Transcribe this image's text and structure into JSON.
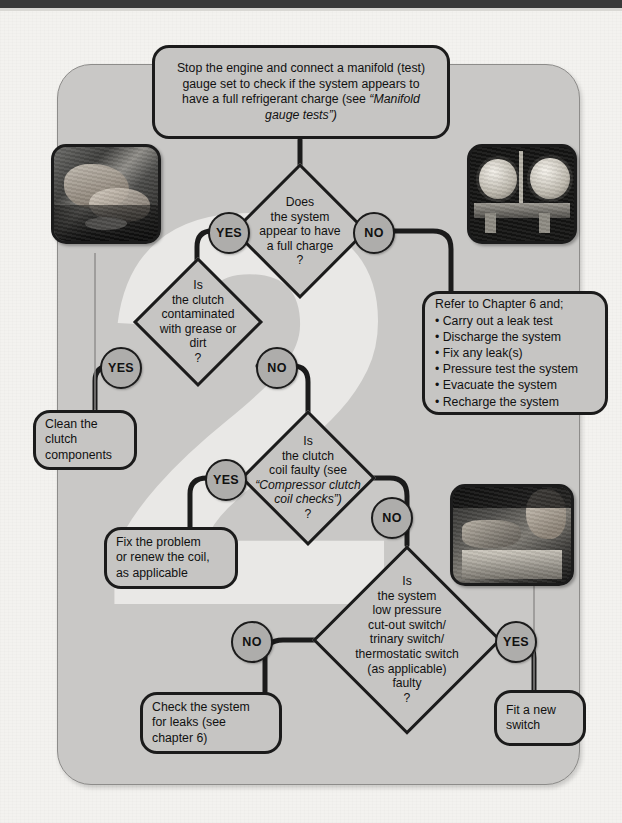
{
  "page": {
    "type": "flowchart",
    "topic": "Air conditioning compressor clutch / system fault-finding",
    "watermark": "2",
    "colors": {
      "panel_bg": "#c9c8c6",
      "paper_bg": "#f3f2ef",
      "node_fill": "#c6c5c3",
      "node_stroke": "#1b1b1b",
      "badge_fill": "#aeadab",
      "watermark": "#e9e8e6",
      "topbar": "#3a3a3a"
    }
  },
  "nodes": {
    "start": {
      "id": "start",
      "shape": "rounded-box",
      "text_lines": [
        "Stop the engine and connect a manifold (test)",
        "gauge set to check if the system appears to",
        "have a full refrigerant charge (see "
      ],
      "italic_tail": "“Manifold gauge tests”)"
    },
    "q1": {
      "id": "q1",
      "shape": "diamond",
      "lines": [
        "Does",
        "the system",
        "appear to have",
        "a full charge",
        "?"
      ]
    },
    "q2": {
      "id": "q2",
      "shape": "diamond",
      "lines": [
        "Is",
        "the clutch",
        "contaminated",
        "with grease or",
        "dirt",
        "?"
      ]
    },
    "q3": {
      "id": "q3",
      "shape": "diamond",
      "lines": [
        "Is",
        "the clutch",
        "coil faulty (see"
      ],
      "italic_lines": [
        "“Compressor clutch",
        "coil checks”)"
      ],
      "tail": "?"
    },
    "q4": {
      "id": "q4",
      "shape": "diamond",
      "lines": [
        "Is",
        "the system",
        "low pressure",
        "cut-out switch/",
        "trinary switch/",
        "thermostatic switch",
        "(as applicable)",
        "faulty",
        "?"
      ]
    },
    "chapter6": {
      "id": "chapter6",
      "shape": "rounded-box",
      "heading": "Refer to Chapter 6 and;",
      "items": [
        "Carry out a leak test",
        "Discharge the system",
        "Fix any leak(s)",
        "Pressure test the system",
        "Evacuate the system",
        "Recharge the system"
      ]
    },
    "clean_clutch": {
      "id": "clean_clutch",
      "shape": "rounded-box",
      "lines": [
        "Clean the",
        "clutch",
        "components"
      ]
    },
    "fix_coil": {
      "id": "fix_coil",
      "shape": "rounded-box",
      "lines": [
        "Fix the problem",
        "or renew the coil,",
        "as applicable"
      ]
    },
    "check_leaks": {
      "id": "check_leaks",
      "shape": "rounded-box",
      "lines": [
        "Check the system",
        "for leaks (see",
        "chapter 6)"
      ]
    },
    "fit_switch": {
      "id": "fit_switch",
      "shape": "rounded-box",
      "lines": [
        "Fit a new",
        "switch"
      ]
    }
  },
  "badges": [
    {
      "id": "q1-yes",
      "label": "YES",
      "from": "q1",
      "to": "q2"
    },
    {
      "id": "q1-no",
      "label": "NO",
      "from": "q1",
      "to": "chapter6"
    },
    {
      "id": "q2-yes",
      "label": "YES",
      "from": "q2",
      "to": "clean_clutch"
    },
    {
      "id": "q2-no",
      "label": "NO",
      "from": "q2",
      "to": "q3"
    },
    {
      "id": "q3-yes",
      "label": "YES",
      "from": "q3",
      "to": "fix_coil"
    },
    {
      "id": "q3-no",
      "label": "NO",
      "from": "q3",
      "to": "q4"
    },
    {
      "id": "q4-no",
      "label": "NO",
      "from": "q4",
      "to": "check_leaks"
    },
    {
      "id": "q4-yes",
      "label": "YES",
      "from": "q4",
      "to": "fit_switch"
    }
  ],
  "photos": [
    {
      "id": "photo-hands-engine",
      "caption_alt": "Hands working on engine bay component"
    },
    {
      "id": "photo-manifold-gauges",
      "caption_alt": "Manifold gauge set with two round dial gauges"
    },
    {
      "id": "photo-technician-engine",
      "caption_alt": "Technician leaning over an engine bay"
    }
  ]
}
